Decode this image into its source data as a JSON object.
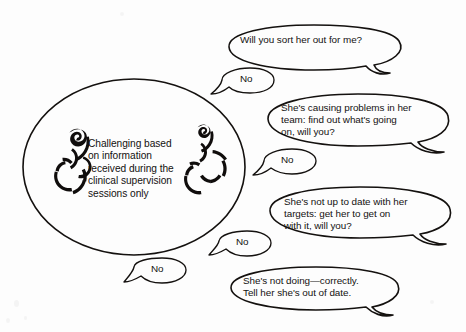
{
  "figure": {
    "kind": "speech-bubble-diagram",
    "background_color": "#fdfdfd",
    "ink_color": "#14110f"
  },
  "oval": {
    "label": "Challenging based\non information\nreceived during the\nclinical supervision\nsessions only",
    "glyph_left_name": "stylized-figure-glyph-left",
    "glyph_right_name": "stylized-figure-glyph-right"
  },
  "bubbles": [
    {
      "id": "bubble-1",
      "text": "Will you sort her out for me?"
    },
    {
      "id": "bubble-2",
      "text": "She's causing problems in her\nteam: find out what's going\non, will you?"
    },
    {
      "id": "bubble-3",
      "text": "She's not up to date with her\ntargets: get her to get on\nwith it, will you?"
    },
    {
      "id": "bubble-4",
      "text": "She's not doing—correctly.\nTell her she's out of date."
    }
  ],
  "replies": [
    {
      "id": "reply-1",
      "text": "No"
    },
    {
      "id": "reply-2",
      "text": "No"
    },
    {
      "id": "reply-3",
      "text": "No"
    },
    {
      "id": "reply-4",
      "text": "No"
    }
  ]
}
